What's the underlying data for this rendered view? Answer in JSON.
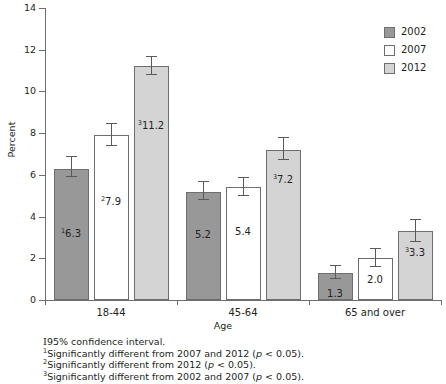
{
  "chart_data": {
    "type": "bar",
    "title": "",
    "xlabel": "Age",
    "ylabel": "Percent",
    "categories": [
      "18-44",
      "45-64",
      "65 and over"
    ],
    "ylim": [
      0,
      14
    ],
    "yticks": [
      0,
      2,
      4,
      6,
      8,
      10,
      12,
      14
    ],
    "ytick_labels": [
      "0",
      "2",
      "4",
      "6",
      "8",
      "10",
      "12",
      "14"
    ],
    "grid": false,
    "legend_position": "top-right",
    "series": [
      {
        "name": "2002",
        "color": "#989898",
        "values": [
          6.3,
          5.2,
          1.3
        ],
        "labels": [
          "6.3",
          "5.2",
          "1.3"
        ],
        "footnote_markers": [
          "1",
          "",
          ""
        ],
        "ci_low": [
          5.9,
          4.8,
          1.0
        ],
        "ci_high": [
          6.9,
          5.7,
          1.7
        ]
      },
      {
        "name": "2007",
        "color": "#ffffff",
        "values": [
          7.9,
          5.4,
          2.0
        ],
        "labels": [
          "7.9",
          "5.4",
          "2.0"
        ],
        "footnote_markers": [
          "2",
          "",
          ""
        ],
        "ci_low": [
          7.4,
          5.0,
          1.6
        ],
        "ci_high": [
          8.5,
          5.9,
          2.5
        ]
      },
      {
        "name": "2012",
        "color": "#d4d4d4",
        "values": [
          11.2,
          7.2,
          3.3
        ],
        "labels": [
          "11.2",
          "7.2",
          "3.3"
        ],
        "footnote_markers": [
          "3",
          "3",
          "3"
        ],
        "ci_low": [
          10.8,
          6.7,
          2.8
        ],
        "ci_high": [
          11.7,
          7.8,
          3.9
        ]
      }
    ]
  },
  "legend": {
    "items": [
      {
        "label": "2002"
      },
      {
        "label": "2007"
      },
      {
        "label": "2012"
      }
    ]
  },
  "footnotes": [
    {
      "marker": "",
      "ci_symbol": "I",
      "text": "95% confidence interval."
    },
    {
      "marker": "1",
      "text_before": "Significantly different from 2007 and 2012 (",
      "italic": "p",
      "text_after": " < 0.05)."
    },
    {
      "marker": "2",
      "text_before": "Significantly different from 2012 (",
      "italic": "p",
      "text_after": " < 0.05)."
    },
    {
      "marker": "3",
      "text_before": "Significantly different from 2002 and 2007 (",
      "italic": "p",
      "text_after": " < 0.05)."
    }
  ]
}
